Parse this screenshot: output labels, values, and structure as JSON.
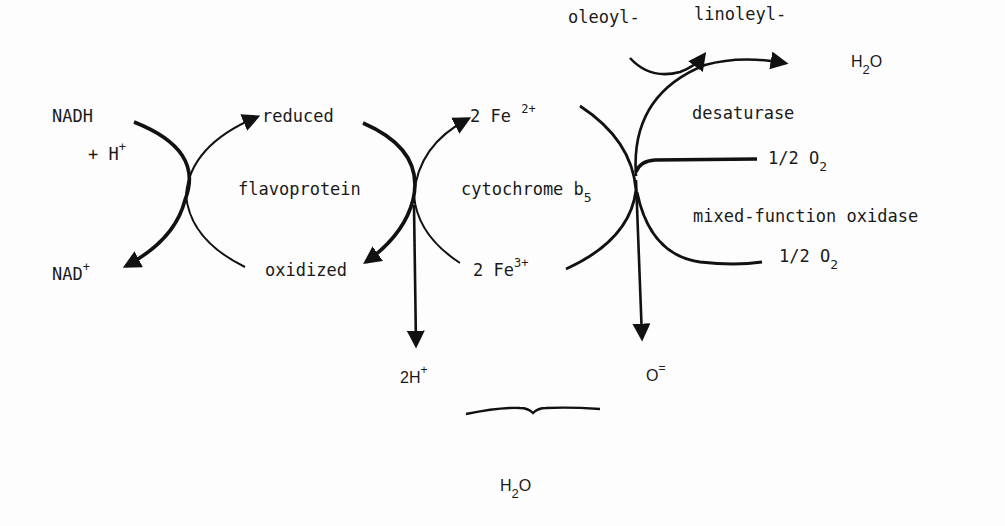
{
  "diagram": {
    "type": "electron-transport-pathway",
    "colors": {
      "ink": "#111111",
      "background": "#fdfdfd"
    },
    "nodes": {
      "nadh": {
        "text": "NADH"
      },
      "h_plus": {
        "prefix": "+ H",
        "sup": "+"
      },
      "nad_plus": {
        "text": "NAD",
        "sup": "+"
      },
      "flavo_reduced": {
        "text": "reduced"
      },
      "flavo_name": {
        "text": "flavoprotein"
      },
      "flavo_oxidized": {
        "text": "oxidized"
      },
      "fe2": {
        "text": "2 Fe",
        "sup": "2+"
      },
      "cyt_name": {
        "text": "cytochrome b",
        "sub": "5"
      },
      "fe3": {
        "text": "2 Fe",
        "sup": "3+"
      },
      "two_h_plus": {
        "text": "2H",
        "sup": "+"
      },
      "oxide": {
        "text": "O",
        "sup": "="
      },
      "oleoyl": {
        "text": "oleoyl-"
      },
      "linoleyl": {
        "text": "linoleyl-"
      },
      "water_top": {
        "pre": "H",
        "sub": "2",
        "post": "O"
      },
      "desaturase": {
        "text": "desaturase"
      },
      "o2_upper": {
        "pre": "1/2 O",
        "sub": "2"
      },
      "mfo": {
        "text": "mixed-function oxidase"
      },
      "o2_lower": {
        "pre": "1/2 O",
        "sub": "2"
      },
      "water_bottom": {
        "pre": "H",
        "sub": "2",
        "post": "O"
      }
    },
    "edges": [
      {
        "from": "NADH + H+",
        "to": "NAD+",
        "style": "thick-arc-arrow"
      },
      {
        "from": "flavoprotein oxidized",
        "to": "flavoprotein reduced",
        "style": "arc-arrow"
      },
      {
        "from": "flavoprotein reduced",
        "to": "flavoprotein oxidized",
        "style": "thick-arc-arrow"
      },
      {
        "from": "2 Fe3+",
        "to": "2 Fe2+",
        "style": "arc-arrow"
      },
      {
        "from": "junction",
        "to": "2H+",
        "style": "down-arrow"
      },
      {
        "from": "cytochrome b5 junction",
        "to": "O=",
        "style": "down-arrow"
      },
      {
        "from": "oleoyl-",
        "to": "linoleyl-",
        "style": "curved-arrow"
      },
      {
        "from": "junction",
        "to": "H2O",
        "style": "arc-arrow"
      },
      {
        "from": "1/2 O2",
        "to": "junction",
        "style": "line"
      },
      {
        "from": "1/2 O2",
        "to": "junction",
        "style": "arc"
      },
      {
        "from": "2H+ + O=",
        "to": "H2O",
        "style": "brace"
      }
    ]
  }
}
